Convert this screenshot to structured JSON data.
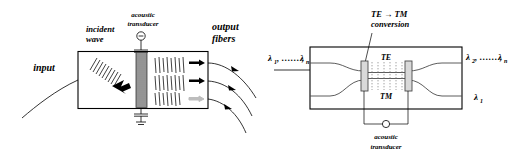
{
  "figure": {
    "panels": [
      "left",
      "right"
    ]
  },
  "left_panel": {
    "name": "bulk acousto-optic wavelength selector",
    "labels": {
      "transducer": {
        "line1": "acoustic",
        "line2": "transducer"
      },
      "incident_wave": {
        "line1": "incident",
        "line2": "wave"
      },
      "input": "input",
      "output_fibers": {
        "line1": "output",
        "line2": "fibers"
      }
    },
    "icons": {
      "source": "circle-source-icon",
      "ground": "ground-icon",
      "beam_arrow": "thick-right-arrow-icon"
    },
    "output_beams": [
      {
        "id": "beam-1",
        "arrow": "solid"
      },
      {
        "id": "beam-2",
        "arrow": "solid"
      },
      {
        "id": "beam-3",
        "arrow": "faint"
      }
    ]
  },
  "right_panel": {
    "name": "integrated acousto-optic TE-TM mode converter filter",
    "labels": {
      "conversion": {
        "line1": "TE → TM",
        "line2": "conversion"
      },
      "mode_te": "TE",
      "mode_tm": "TM",
      "transducer": {
        "line1": "acoustic",
        "line2": "transducer"
      }
    },
    "ports": {
      "input": {
        "text": "λ",
        "sub1": "1",
        "mid": ", …… ,",
        "text2": "λ",
        "sub2": "n"
      },
      "output_top": {
        "text": "λ",
        "sub1": "2",
        "mid": ", …… ,",
        "text2": "λ",
        "sub2": "n"
      },
      "output_bottom": {
        "text": "λ",
        "sub1": "1"
      }
    },
    "icons": {
      "source": "circle-source-icon",
      "pointer": "conversion-pointer-arrow-icon"
    }
  },
  "colors": {
    "ink": "#000000",
    "line": "#4a4a4a",
    "grating": "#2b2b2b",
    "faint": "#bdbdbd",
    "pad_fill": "#d9d9d9",
    "background": "#ffffff"
  }
}
